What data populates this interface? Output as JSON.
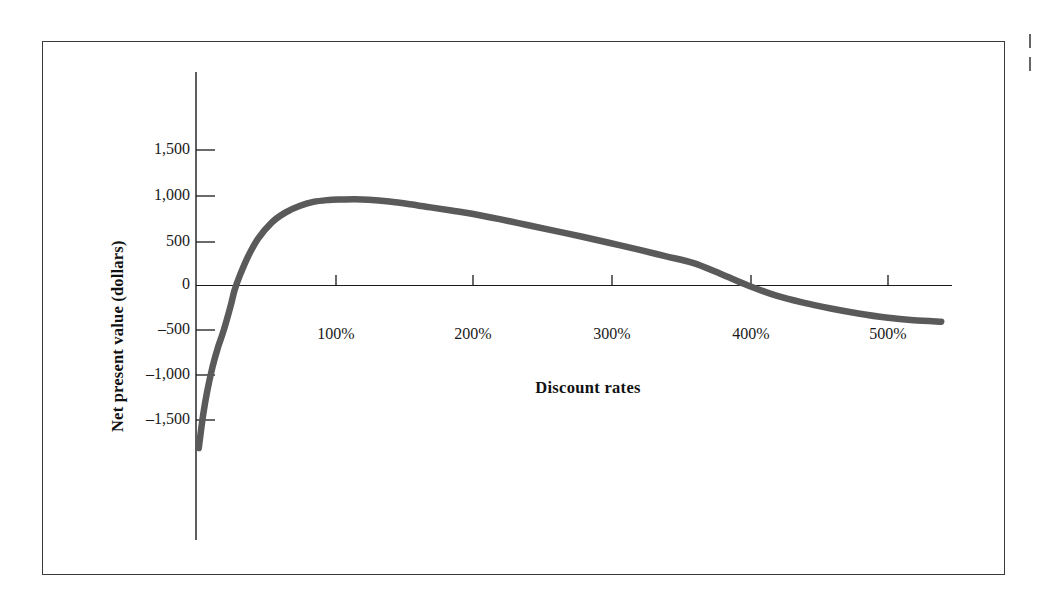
{
  "figure": {
    "frame_color": "#3a3a3a",
    "background": "#ffffff"
  },
  "chart_data": {
    "type": "line",
    "title": "",
    "subtitle": "",
    "xlabel": "Discount rates",
    "ylabel": "Net present value (dollars)",
    "curve_color": "#5a5a5a",
    "axis_color": "#1a1a1a",
    "grid": false,
    "legend": null,
    "xlim": [
      0,
      545
    ],
    "ylim": [
      -2100,
      1950
    ],
    "xticks": [
      100,
      200,
      300,
      400,
      500
    ],
    "xtick_labels": [
      "100%",
      "200%",
      "300%",
      "400%",
      "500%"
    ],
    "yticks": [
      1500,
      1000,
      500,
      0,
      -500,
      -1000,
      -1500
    ],
    "ytick_labels": [
      "1,500",
      "1,000",
      "500",
      "0",
      "–500",
      "–1,000",
      "–1,500"
    ],
    "zero_crossings": [
      28,
      400
    ],
    "peak": {
      "x": 115,
      "y": 950
    },
    "x": [
      2,
      5,
      8,
      12,
      16,
      20,
      25,
      28,
      32,
      38,
      45,
      55,
      65,
      75,
      85,
      95,
      105,
      115,
      125,
      140,
      155,
      170,
      185,
      200,
      220,
      240,
      260,
      280,
      300,
      320,
      340,
      360,
      380,
      400,
      420,
      440,
      460,
      480,
      500,
      520,
      540
    ],
    "y": [
      -1800,
      -1450,
      -1180,
      -900,
      -680,
      -500,
      -230,
      -50,
      120,
      330,
      520,
      700,
      810,
      880,
      925,
      945,
      952,
      955,
      950,
      930,
      900,
      865,
      830,
      795,
      735,
      670,
      605,
      540,
      470,
      400,
      325,
      250,
      130,
      0,
      -110,
      -190,
      -255,
      -310,
      -355,
      -385,
      -400
    ]
  },
  "axis_titles": {
    "y": "Net present value (dollars)",
    "x": "Discount rates"
  },
  "edge_marks": {
    "count": 2,
    "note": "faint page-scan marks at right margin"
  }
}
